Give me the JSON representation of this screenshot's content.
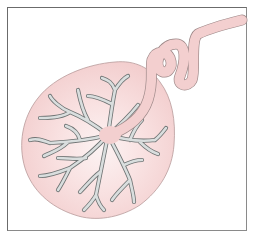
{
  "illustration": {
    "subject": "placenta with umbilical cord",
    "parts": [
      "placenta-disc",
      "chorionic-vessels",
      "cord-insertion",
      "umbilical-cord"
    ],
    "colors": {
      "tissue": "#f5d3d3",
      "tissue_center": "#fbeeee",
      "tissue_outline": "#b89a9a",
      "vessels": "#d7dcdc",
      "vessel_outline": "#6e7373",
      "cord": "#f3cfcf",
      "cord_outline": "#9f8a8a",
      "frame": "#6b6b6b"
    }
  }
}
